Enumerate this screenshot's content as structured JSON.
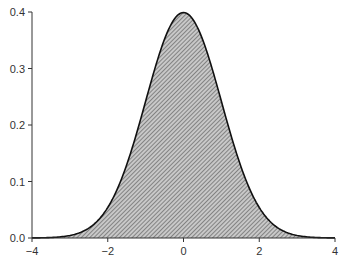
{
  "chart_data": {
    "type": "area",
    "title": "",
    "xlabel": "",
    "ylabel": "",
    "function": "normal_pdf",
    "mean": 0,
    "sd": 1,
    "xlim": [
      -4,
      4
    ],
    "ylim": [
      0,
      0.4
    ],
    "x_ticks": [
      -4,
      -2,
      0,
      2,
      4
    ],
    "x_tick_labels": [
      "−4",
      "−2",
      "0",
      "2",
      "4"
    ],
    "y_ticks": [
      0.0,
      0.1,
      0.2,
      0.3,
      0.4
    ],
    "y_tick_labels": [
      "0.0",
      "0.1",
      "0.2",
      "0.3",
      "0.4"
    ],
    "grid": false,
    "legend": null,
    "x": [
      -4,
      -3.5,
      -3,
      -2.5,
      -2,
      -1.5,
      -1,
      -0.5,
      0,
      0.5,
      1,
      1.5,
      2,
      2.5,
      3,
      3.5,
      4
    ],
    "values": [
      0.0001,
      0.0009,
      0.0044,
      0.0175,
      0.054,
      0.1295,
      0.242,
      0.3521,
      0.3989,
      0.3521,
      0.242,
      0.1295,
      0.054,
      0.0175,
      0.0044,
      0.0009,
      0.0001
    ],
    "colors": {
      "fill": "#c8c8c8",
      "hatch": "#555555",
      "curve": "#111111",
      "axis": "#333333"
    }
  }
}
